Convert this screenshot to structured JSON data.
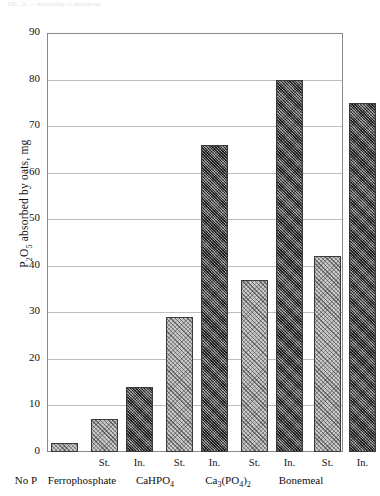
{
  "figure": {
    "top_caption_fragment": "FIG. 21. —  Availability of phosphorus",
    "background": "#ffffff"
  },
  "chart_data": {
    "type": "bar",
    "title": "",
    "xlabel": "",
    "ylabel": "P₂O₅ absorbed by oats, mg",
    "ylabel_parts": {
      "prefix": "P",
      "sub1": "2",
      "mid": "O",
      "sub2": "5",
      "suffix": " absorbed by oats, mg"
    },
    "ylim": [
      0,
      90
    ],
    "ytick_step": 10,
    "yticks": [
      "0",
      "10",
      "20",
      "30",
      "40",
      "50",
      "60",
      "70",
      "80",
      "90"
    ],
    "grid": true,
    "legend": "none",
    "categories": [
      "No P",
      "Ferrophosphate",
      "CaHPO4",
      "Ca3(PO4)2",
      "Bonemeal"
    ],
    "groups": [
      {
        "name": "No P",
        "label_parts": [
          {
            "t": "No P",
            "sub": ""
          }
        ],
        "bars": [
          {
            "sublabel": "",
            "series": "St.",
            "value": 2,
            "pattern": "light-hatch"
          }
        ]
      },
      {
        "name": "Ferrophosphate",
        "label_parts": [
          {
            "t": "Ferrophosphate",
            "sub": ""
          }
        ],
        "bars": [
          {
            "sublabel": "St.",
            "series": "St.",
            "value": 7,
            "pattern": "light-hatch"
          },
          {
            "sublabel": "In.",
            "series": "In.",
            "value": 14,
            "pattern": "dark-hatch"
          }
        ]
      },
      {
        "name": "CaHPO4",
        "label_parts": [
          {
            "t": "CaHPO",
            "sub": "4"
          }
        ],
        "bars": [
          {
            "sublabel": "St.",
            "series": "St.",
            "value": 29,
            "pattern": "light-hatch"
          },
          {
            "sublabel": "In.",
            "series": "In.",
            "value": 66,
            "pattern": "dark-hatch"
          }
        ]
      },
      {
        "name": "Ca3(PO4)2",
        "label_parts": [
          {
            "t": "Ca",
            "sub": "3"
          },
          {
            "t": "(PO",
            "sub": "4"
          },
          {
            "t": ")",
            "sub": "2"
          }
        ],
        "bars": [
          {
            "sublabel": "St.",
            "series": "St.",
            "value": 37,
            "pattern": "light-hatch"
          },
          {
            "sublabel": "In.",
            "series": "In.",
            "value": 80,
            "pattern": "dark-hatch"
          }
        ]
      },
      {
        "name": "Bonemeal",
        "label_parts": [
          {
            "t": "Bonemeal",
            "sub": ""
          }
        ],
        "bars": [
          {
            "sublabel": "St.",
            "series": "St.",
            "value": 42,
            "pattern": "light-hatch"
          },
          {
            "sublabel": "In.",
            "series": "In.",
            "value": 75,
            "pattern": "dark-hatch"
          }
        ]
      }
    ],
    "series_names": [
      "St.",
      "In."
    ],
    "colors": {
      "light_bar": "#c9c9c9",
      "dark_bar": "#5e5e5e",
      "bar_border": "#3a3a3a",
      "gridline": "#bdbdbd",
      "frame": "#8a8a8a",
      "text": "#111111"
    }
  }
}
